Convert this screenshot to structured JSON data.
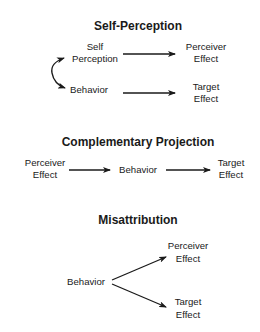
{
  "diagrams": [
    {
      "title": "Self-Perception",
      "nodes": {
        "self_perception": [
          "Self",
          "Perception"
        ],
        "behavior": [
          "Behavior"
        ],
        "perceiver_effect": [
          "Perceiver",
          "Effect"
        ],
        "target_effect": [
          "Target",
          "Effect"
        ]
      },
      "edges": [
        [
          "self_perception",
          "perceiver_effect"
        ],
        [
          "behavior",
          "target_effect"
        ],
        [
          "self_perception",
          "behavior",
          "bidirectional"
        ]
      ]
    },
    {
      "title": "Complementary Projection",
      "nodes": {
        "perceiver_effect": [
          "Perceiver",
          "Effect"
        ],
        "behavior": [
          "Behavior"
        ],
        "target_effect": [
          "Target",
          "Effect"
        ]
      },
      "edges": [
        [
          "perceiver_effect",
          "behavior"
        ],
        [
          "behavior",
          "target_effect"
        ]
      ]
    },
    {
      "title": "Misattribution",
      "nodes": {
        "behavior": [
          "Behavior"
        ],
        "perceiver_effect": [
          "Perceiver",
          "Effect"
        ],
        "target_effect": [
          "Target",
          "Effect"
        ]
      },
      "edges": [
        [
          "behavior",
          "perceiver_effect"
        ],
        [
          "behavior",
          "target_effect"
        ]
      ]
    }
  ],
  "colors": {
    "ink": "#1a1a1a",
    "background": "#ffffff"
  }
}
